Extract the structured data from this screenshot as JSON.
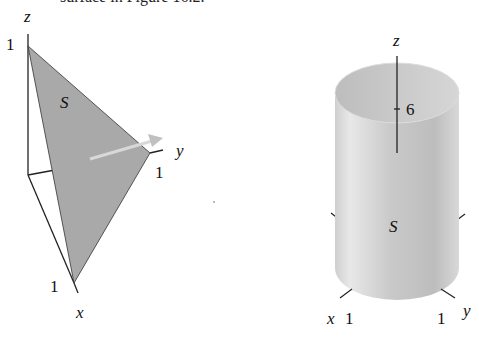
{
  "top_cut_text": "surface in Figure 16.2.",
  "figure_left": {
    "axis_labels": {
      "z": "z",
      "y": "y",
      "x": "x"
    },
    "ticks": {
      "z": "1",
      "y": "1",
      "x": "1"
    },
    "surface_label": "S",
    "colors": {
      "surface": "#a9a9a9",
      "arrow": "#c8c8c8",
      "lines": "#222222"
    }
  },
  "figure_right": {
    "axis_labels": {
      "z": "z",
      "x": "x",
      "y": "y"
    },
    "ticks": {
      "z": "6",
      "x": "1",
      "y": "1"
    },
    "surface_label": "S",
    "colors": {
      "surface_light": "#f2f2f2",
      "surface_dark": "#b8b8b8",
      "lines": "#222222"
    }
  }
}
